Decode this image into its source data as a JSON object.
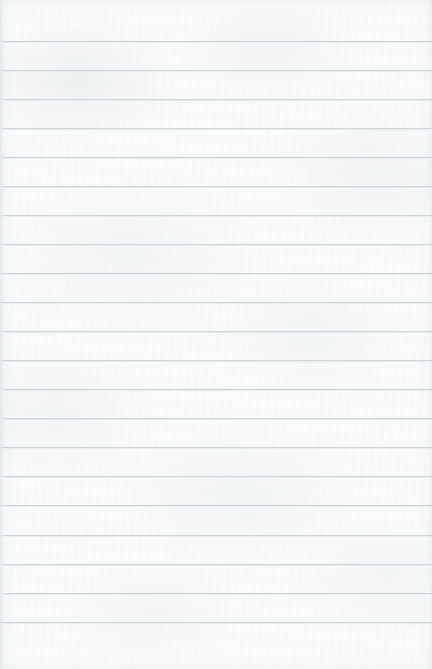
{
  "document": {
    "type": "lined-notebook-paper",
    "title": "Blank ruled paper sheet",
    "content_text": "",
    "width_px": 432,
    "height_px": 669,
    "is_blank": "true"
  },
  "paper": {
    "background_color": "#fafbfb",
    "edge_color": "#e4e8eb",
    "texture": "subtle mottled fibre grain"
  },
  "rules": {
    "label": "Horizontal ruled lines",
    "color": "#cbd1d7",
    "halo_color": "#e9edf0",
    "thickness_px": 1,
    "spacing_px": 29.1,
    "first_line_y": 41,
    "count": 21,
    "line_y_positions": [
      41,
      70,
      99,
      128,
      157,
      186,
      215,
      244,
      273,
      302,
      331,
      360,
      389,
      418,
      447,
      476,
      505,
      535,
      564,
      593,
      622
    ],
    "left_inset_px": 0,
    "right_inset_px": 0
  },
  "margin_rule": {
    "present": "false"
  }
}
